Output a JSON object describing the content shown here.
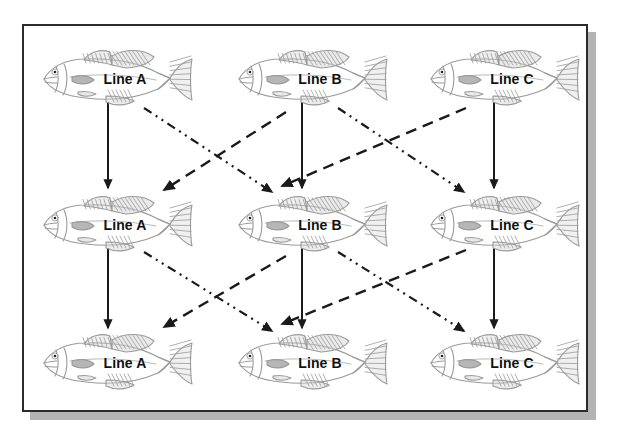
{
  "figure": {
    "frame": {
      "border_color": "#2b2b2b",
      "shadow_color": "#b4b4b4",
      "background": "#ffffff"
    }
  },
  "nodes": [
    {
      "id": "r1c1",
      "label": "Line A",
      "row": 1,
      "col": 1,
      "x": 34,
      "y": 46
    },
    {
      "id": "r1c2",
      "label": "Line B",
      "row": 1,
      "col": 2,
      "x": 229,
      "y": 46
    },
    {
      "id": "r1c3",
      "label": "Line C",
      "row": 1,
      "col": 3,
      "x": 421,
      "y": 46
    },
    {
      "id": "r2c1",
      "label": "Line A",
      "row": 2,
      "col": 1,
      "x": 34,
      "y": 192
    },
    {
      "id": "r2c2",
      "label": "Line B",
      "row": 2,
      "col": 2,
      "x": 229,
      "y": 192
    },
    {
      "id": "r2c3",
      "label": "Line C",
      "row": 2,
      "col": 3,
      "x": 421,
      "y": 192
    },
    {
      "id": "r3c1",
      "label": "Line A",
      "row": 3,
      "col": 1,
      "x": 34,
      "y": 330
    },
    {
      "id": "r3c2",
      "label": "Line B",
      "row": 3,
      "col": 2,
      "x": 229,
      "y": 330
    },
    {
      "id": "r3c3",
      "label": "Line C",
      "row": 3,
      "col": 3,
      "x": 421,
      "y": 330
    }
  ],
  "edges": [
    {
      "id": "e1",
      "from": "r1c1",
      "to": "r2c1",
      "style": "solid",
      "x1": 108,
      "y1": 102,
      "x2": 108,
      "y2": 188
    },
    {
      "id": "e2",
      "from": "r1c2",
      "to": "r2c2",
      "style": "solid",
      "x1": 302,
      "y1": 102,
      "x2": 302,
      "y2": 188
    },
    {
      "id": "e3",
      "from": "r1c3",
      "to": "r2c3",
      "style": "solid",
      "x1": 494,
      "y1": 102,
      "x2": 494,
      "y2": 188
    },
    {
      "id": "e4",
      "from": "r1c1",
      "to": "r2c2",
      "style": "dashdot",
      "x1": 144,
      "y1": 108,
      "x2": 272,
      "y2": 192
    },
    {
      "id": "e5",
      "from": "r1c2",
      "to": "r2c3",
      "style": "dashdot",
      "x1": 338,
      "y1": 108,
      "x2": 464,
      "y2": 192
    },
    {
      "id": "e6",
      "from": "r1c2",
      "to": "r2c1",
      "style": "dashed",
      "x1": 286,
      "y1": 112,
      "x2": 164,
      "y2": 190
    },
    {
      "id": "e7",
      "from": "r1c3",
      "to": "r2c2",
      "style": "dashed",
      "x1": 466,
      "y1": 108,
      "x2": 282,
      "y2": 186
    },
    {
      "id": "e8",
      "from": "r2c1",
      "to": "r3c1",
      "style": "solid",
      "x1": 108,
      "y1": 248,
      "x2": 108,
      "y2": 328
    },
    {
      "id": "e9",
      "from": "r2c2",
      "to": "r3c2",
      "style": "solid",
      "x1": 302,
      "y1": 248,
      "x2": 302,
      "y2": 328
    },
    {
      "id": "e10",
      "from": "r2c3",
      "to": "r3c3",
      "style": "solid",
      "x1": 494,
      "y1": 248,
      "x2": 494,
      "y2": 328
    },
    {
      "id": "e11",
      "from": "r2c1",
      "to": "r3c2",
      "style": "dashdot",
      "x1": 144,
      "y1": 252,
      "x2": 272,
      "y2": 331
    },
    {
      "id": "e12",
      "from": "r2c2",
      "to": "r3c3",
      "style": "dashdot",
      "x1": 338,
      "y1": 252,
      "x2": 464,
      "y2": 331
    },
    {
      "id": "e13",
      "from": "r2c2",
      "to": "r3c1",
      "style": "dashed",
      "x1": 286,
      "y1": 256,
      "x2": 164,
      "y2": 327
    },
    {
      "id": "e14",
      "from": "r2c3",
      "to": "r3c2",
      "style": "dashed",
      "x1": 466,
      "y1": 250,
      "x2": 282,
      "y2": 324
    }
  ],
  "line_styles": {
    "solid": {
      "name": "solid-arrow",
      "dasharray": "",
      "color": "#1a1a1a",
      "width": 2
    },
    "dashed": {
      "name": "dashed-arrow",
      "dasharray": "11 7",
      "color": "#1a1a1a",
      "width": 2.4
    },
    "dashdot": {
      "name": "dash-dot-dot-arrow",
      "dasharray": "9 5 2 5 2 5",
      "color": "#1a1a1a",
      "width": 2.2
    }
  },
  "fish": {
    "icon": "fish-icon",
    "body_stroke": "#9a9a9a",
    "fin_fill": "#d9d9d9",
    "eye_color": "#222222"
  }
}
